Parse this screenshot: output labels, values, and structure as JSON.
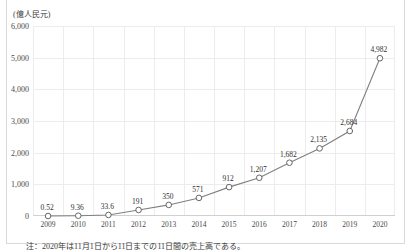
{
  "chart_data": {
    "type": "line",
    "title": "",
    "subtitle": "",
    "xlabel": "",
    "ylabel": "(億人民元)",
    "unit_label": "(億人民元)",
    "categories": [
      "2009",
      "2010",
      "2011",
      "2012",
      "2013",
      "2014",
      "2015",
      "2016",
      "2017",
      "2018",
      "2019",
      "2020"
    ],
    "values": [
      0.52,
      9.36,
      33.6,
      191,
      350,
      571,
      912,
      1207,
      1682,
      2135,
      2684,
      4982
    ],
    "point_labels": [
      "0.52",
      "9.36",
      "33.6",
      "191",
      "350",
      "571",
      "912",
      "1,207",
      "1,682",
      "2,135",
      "2,684",
      "4,982"
    ],
    "ylim": [
      0,
      6000
    ],
    "yticks": [
      0,
      1000,
      2000,
      3000,
      4000,
      5000,
      6000
    ],
    "ytick_labels": [
      "0",
      "1,000",
      "2,000",
      "3,000",
      "4,000",
      "5,000",
      "6,000"
    ],
    "grid": true,
    "grid_vertical": true,
    "legend": false,
    "legend_position": "none",
    "series": [
      {
        "name": "売上高",
        "values": [
          0.52,
          9.36,
          33.6,
          191,
          350,
          571,
          912,
          1207,
          1682,
          2135,
          2684,
          4982
        ],
        "line_color": "#808080",
        "marker": "open-circle",
        "marker_fill": "#ffffff",
        "marker_edge_color": "#666666"
      }
    ],
    "annotations": [],
    "note": "注：2020年は11月1日から11日までの11日間の売上高である。"
  },
  "colors": {
    "grid": "#ececec",
    "axis": "#d0d0d0",
    "frame": "#d9d9d9",
    "text": "#3a3a3a",
    "line": "#808080",
    "marker_edge": "#666666"
  }
}
